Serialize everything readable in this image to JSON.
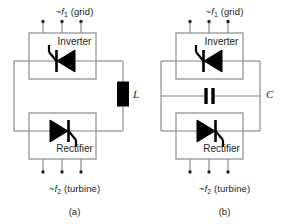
{
  "figure": {
    "type": "circuit-diagram",
    "background": "#ffffff",
    "line_color": "#808285",
    "symbol_color": "#000000",
    "text_color": "#231f20"
  },
  "panels": [
    {
      "id": "a",
      "caption": "(a)",
      "top_label": {
        "tilde": "~",
        "symbol": "f",
        "subscript": "1",
        "source": "(grid)",
        "full": "~f1 (grid)"
      },
      "bottom_label": {
        "tilde": "~",
        "symbol": "f",
        "subscript": "2",
        "source": "(turbine)",
        "full": "~f2 (turbine)"
      },
      "top_block": {
        "label": "Inverter",
        "symbol": "thyristor-left"
      },
      "bottom_block": {
        "label": "Rectifier",
        "symbol": "thyristor-right"
      },
      "link_component": {
        "label": "L",
        "name": "inductor",
        "orientation": "vertical",
        "side": "right"
      },
      "terminal_count": 3
    },
    {
      "id": "b",
      "caption": "(b)",
      "top_label": {
        "tilde": "~",
        "symbol": "f",
        "subscript": "1",
        "source": "(grid)",
        "full": "~f1 (grid)"
      },
      "bottom_label": {
        "tilde": "~",
        "symbol": "f",
        "subscript": "2",
        "source": "(turbine)",
        "full": "~f2 (turbine)"
      },
      "top_block": {
        "label": "Inverter",
        "symbol": "thyristor-left"
      },
      "bottom_block": {
        "label": "Rectifier",
        "symbol": "thyristor-right"
      },
      "link_component": {
        "label": "C",
        "name": "capacitor",
        "orientation": "vertical-plates",
        "side": "middle"
      },
      "terminal_count": 3
    }
  ]
}
